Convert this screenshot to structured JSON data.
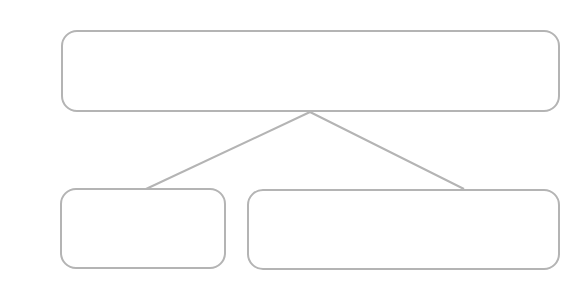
{
  "problem": {
    "number": "2"
  },
  "diagram": {
    "colors": {
      "border": "#b4b4b4",
      "cross": "#7a7a7a",
      "diamond": "#8a8a8a",
      "line": "#b4b4b4"
    },
    "top_box": {
      "symbols": [
        "cross",
        "cross",
        "diamond",
        "diamond",
        "diamond",
        "diamond",
        "diamond",
        "diamond",
        "diamond",
        "diamond"
      ]
    },
    "bottom_left_box": {
      "symbols": [
        "cross",
        "cross"
      ]
    },
    "bottom_right_box": {
      "symbols": []
    }
  }
}
